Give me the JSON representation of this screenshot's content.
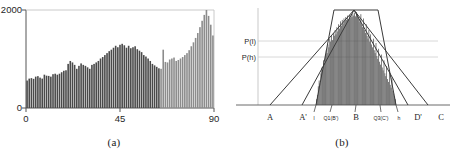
{
  "figure": {
    "panel_a": {
      "caption": "(a)",
      "y_axis": {
        "top_label": "2000",
        "bottom_label": "0",
        "max": 2000,
        "min": 0
      },
      "x_axis": {
        "labels": [
          "0",
          "45",
          "90"
        ],
        "min": 0,
        "max": 90
      }
    },
    "panel_b": {
      "caption": "(b)",
      "probability_labels": {
        "upper": "P(l)",
        "lower": "P(h)"
      },
      "baseline_labels": [
        {
          "name": "A",
          "tick": false
        },
        {
          "name": "A'",
          "tick": false
        },
        {
          "name": "l",
          "tick": true
        },
        {
          "name": "Q1(B')",
          "tick": true
        },
        {
          "name": "B",
          "tick": true
        },
        {
          "name": "Q3(C')",
          "tick": true
        },
        {
          "name": "h",
          "tick": true
        },
        {
          "name": "D'",
          "tick": false
        },
        {
          "name": "C",
          "tick": false
        }
      ]
    }
  },
  "colors": {
    "bar_dark": "#4a4a4a",
    "bar_light": "#8c8c8c",
    "axis": "#555555",
    "line": "#3a3a3a",
    "guide": "#d8d8d8",
    "background": "#ffffff"
  },
  "chart_data": [
    {
      "type": "bar",
      "id": "panel-a-histogram",
      "title": "",
      "xlabel": "",
      "ylabel": "",
      "xlim": [
        0,
        90
      ],
      "ylim": [
        0,
        2000
      ],
      "grid": false,
      "legend": null,
      "xticks": [
        0,
        45,
        90
      ],
      "yticks": [
        0,
        2000
      ],
      "xticklabels": [
        "0",
        "45",
        "90"
      ],
      "yticklabels": [
        "0",
        "2000"
      ],
      "bin_count": 90,
      "segment_split_index": 62,
      "segment_colors": [
        "#4a4a4a",
        "#8c8c8c"
      ],
      "categories": [
        0,
        1,
        2,
        3,
        4,
        5,
        6,
        7,
        8,
        9,
        10,
        11,
        12,
        13,
        14,
        15,
        16,
        17,
        18,
        19,
        20,
        21,
        22,
        23,
        24,
        25,
        26,
        27,
        28,
        29,
        30,
        31,
        32,
        33,
        34,
        35,
        36,
        37,
        38,
        39,
        40,
        41,
        42,
        43,
        44,
        45,
        46,
        47,
        48,
        49,
        50,
        51,
        52,
        53,
        54,
        55,
        56,
        57,
        58,
        59,
        60,
        61,
        62,
        63,
        64,
        65,
        66,
        67,
        68,
        69,
        70,
        71,
        72,
        73,
        74,
        75,
        76,
        77,
        78,
        79,
        80,
        81,
        82,
        83,
        84,
        85,
        86,
        87,
        88,
        89
      ],
      "values": [
        560,
        600,
        610,
        595,
        640,
        650,
        620,
        600,
        680,
        660,
        655,
        640,
        690,
        700,
        680,
        700,
        730,
        760,
        770,
        900,
        960,
        930,
        880,
        800,
        860,
        910,
        880,
        860,
        830,
        800,
        880,
        900,
        930,
        960,
        1010,
        1040,
        1080,
        1120,
        1160,
        1190,
        1230,
        1270,
        1240,
        1290,
        1310,
        1280,
        1230,
        1270,
        1220,
        1240,
        1260,
        1200,
        1170,
        1140,
        1080,
        1050,
        1010,
        960,
        900,
        870,
        840,
        810,
        800,
        1190,
        940,
        930,
        990,
        1010,
        1030,
        960,
        980,
        1010,
        1040,
        1080,
        1120,
        1180,
        1260,
        1340,
        1430,
        1530,
        1650,
        1780,
        1900,
        2000,
        1880,
        1700,
        1480
      ]
    },
    {
      "type": "bar",
      "id": "panel-b-histogram",
      "title": "",
      "xlabel": "",
      "ylabel": "",
      "grid": false,
      "legend": null,
      "bar_color": "#4a4a4a",
      "annotations": [
        "P(l)",
        "P(h)",
        "A",
        "A'",
        "l",
        "Q1(B')",
        "B",
        "Q3(C')",
        "h",
        "D'",
        "C"
      ],
      "overlays": [
        {
          "name": "outer-triangle",
          "points": "A-peak-C"
        },
        {
          "name": "inner-triangle",
          "points": "A'-peak-D'"
        },
        {
          "name": "trapezoid",
          "points": "l-top-left, top-right, h"
        },
        {
          "name": "guide-line-upper",
          "value": "P(l)"
        },
        {
          "name": "guide-line-lower",
          "value": "P(h)"
        }
      ],
      "values": [
        8,
        14,
        26,
        34,
        30,
        44,
        52,
        48,
        62,
        58,
        70,
        76,
        72,
        84,
        80,
        92,
        88,
        96,
        90,
        100,
        96,
        104,
        98,
        108,
        102,
        112,
        106,
        116,
        110,
        118,
        113,
        120,
        116,
        122,
        118,
        124,
        119,
        125,
        121,
        126,
        122,
        127,
        124,
        128,
        123,
        129,
        125,
        122,
        119,
        115,
        126,
        112,
        108,
        120,
        104,
        100,
        112,
        96,
        92,
        104,
        88,
        98,
        84,
        80,
        92,
        76,
        72,
        86,
        68,
        64,
        78,
        60,
        56,
        70,
        52,
        48,
        62,
        44,
        40,
        54,
        36,
        32,
        46,
        28,
        24,
        38,
        20,
        16,
        12,
        8
      ]
    }
  ]
}
